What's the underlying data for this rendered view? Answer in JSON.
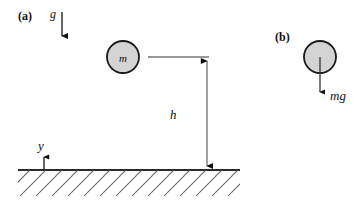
{
  "figure": {
    "background_color": "#ffffff",
    "ink_color": "#111111",
    "ball_fill_color": "#d4d4d4",
    "ball_stroke_color": "#1a1a1a",
    "width": 364,
    "height": 209
  },
  "panel_a": {
    "tag": "(a)",
    "gravity_label": "g",
    "mass_label": "m",
    "height_label": "h",
    "axis_label": "y",
    "ball": {
      "cx": 123,
      "cy": 57,
      "r": 16
    },
    "gravity_arrow": {
      "x": 62,
      "y1": 12,
      "y2": 43
    },
    "height_arrow": {
      "x": 207,
      "y_top": 57,
      "y_bottom": 170
    },
    "top_tick": {
      "x1": 148,
      "x2": 209,
      "y": 57
    },
    "ground_line": {
      "x1": 18,
      "x2": 240,
      "y": 170
    },
    "y_arrow": {
      "x": 44,
      "y1": 170,
      "y2": 155
    }
  },
  "panel_b": {
    "tag": "(b)",
    "force_label": "mg",
    "ball": {
      "cx": 320,
      "cy": 57,
      "r": 16
    },
    "force_arrow": {
      "x": 320,
      "y1": 57,
      "y2": 98
    }
  }
}
